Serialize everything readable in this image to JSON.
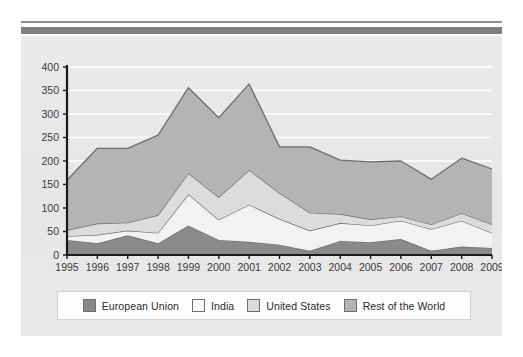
{
  "chart_data": {
    "type": "area",
    "stacked": true,
    "title": "",
    "subtitle": "",
    "xlabel": "",
    "ylabel": "",
    "x": [
      1995,
      1996,
      1997,
      1998,
      1999,
      2000,
      2001,
      2002,
      2003,
      2004,
      2005,
      2006,
      2007,
      2008,
      2009
    ],
    "categories": [
      "1995",
      "1996",
      "1997",
      "1998",
      "1999",
      "2000",
      "2001",
      "2002",
      "2003",
      "2004",
      "2005",
      "2006",
      "2007",
      "2008",
      "2009"
    ],
    "ylim": [
      0,
      400
    ],
    "yticks": [
      0,
      50,
      100,
      150,
      200,
      250,
      300,
      350,
      400
    ],
    "ytick_labels": [
      "0",
      "50",
      "100",
      "150",
      "200",
      "250",
      "300",
      "350",
      "400"
    ],
    "grid": true,
    "grid_axis": "y",
    "legend_position": "bottom",
    "series": [
      {
        "name": "European Union",
        "color": "#8a8a8a",
        "values": [
          32,
          25,
          42,
          25,
          63,
          32,
          28,
          22,
          9,
          30,
          27,
          34,
          9,
          18,
          15
        ]
      },
      {
        "name": "India",
        "color": "#f2f2f2",
        "values": [
          8,
          18,
          10,
          22,
          66,
          43,
          79,
          55,
          43,
          38,
          36,
          39,
          46,
          55,
          32
        ]
      },
      {
        "name": "United States",
        "color": "#dcdcdc",
        "values": [
          13,
          24,
          17,
          38,
          45,
          48,
          74,
          55,
          38,
          19,
          13,
          9,
          10,
          16,
          18
        ]
      },
      {
        "name": "Rest of the World",
        "color": "#b4b4b4",
        "values": [
          106,
          160,
          158,
          170,
          182,
          169,
          183,
          98,
          140,
          115,
          122,
          118,
          96,
          117,
          118
        ]
      }
    ],
    "totals": [
      159,
      227,
      227,
      255,
      356,
      292,
      364,
      230,
      230,
      202,
      198,
      200,
      161,
      206,
      183
    ]
  },
  "legend": {
    "items": [
      {
        "label": "European Union",
        "color": "#8a8a8a"
      },
      {
        "label": "India",
        "color": "#f7f7f7"
      },
      {
        "label": "United States",
        "color": "#dcdcdc"
      },
      {
        "label": "Rest of the World",
        "color": "#b4b4b4"
      }
    ]
  },
  "colors": {
    "panel_background": "#e8e8e8",
    "page_background": "#ffffff",
    "rule": "#7e7e7e",
    "axis": "#1a1a1a",
    "gridline": "#ffffff",
    "series_outline": "#6e6e6e",
    "text": "#3a3a3a"
  }
}
